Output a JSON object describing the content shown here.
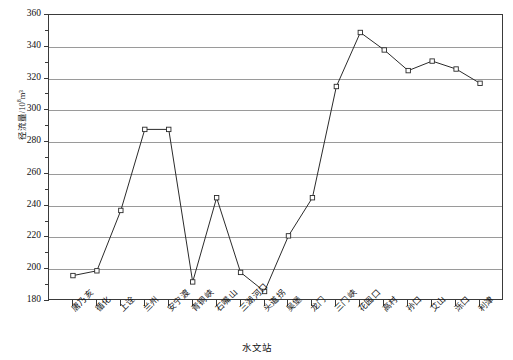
{
  "chart_data": {
    "type": "line",
    "title": "",
    "xlabel": "水文站",
    "ylabel": "径流量/10⁸m³",
    "ylabel_main": "径流量/10",
    "ylabel_exp": "8",
    "ylabel_unit": "m³",
    "ylim": [
      180,
      360
    ],
    "ytick_step": 20,
    "yticks": [
      180,
      200,
      220,
      240,
      260,
      280,
      300,
      320,
      340,
      360
    ],
    "grid": true,
    "legend": "none",
    "marker": "open-square",
    "line_color": "#2b2b2b",
    "grid_color": "#9a9a9a",
    "axis_color": "#3a3a3a",
    "categories": [
      "唐乃亥",
      "循化",
      "上诠",
      "兰州",
      "安宁渡",
      "青铜峡",
      "石嘴山",
      "三湖河口",
      "头道拐",
      "吴堡",
      "龙门",
      "三门峡",
      "花园口",
      "高村",
      "孙口",
      "艾山",
      "泺口",
      "利津"
    ],
    "values": [
      196,
      199,
      237,
      288,
      288,
      192,
      245,
      198,
      186,
      221,
      245,
      315,
      349,
      338,
      325,
      331,
      326,
      317
    ]
  },
  "axis": {
    "x_title": "水文站"
  }
}
